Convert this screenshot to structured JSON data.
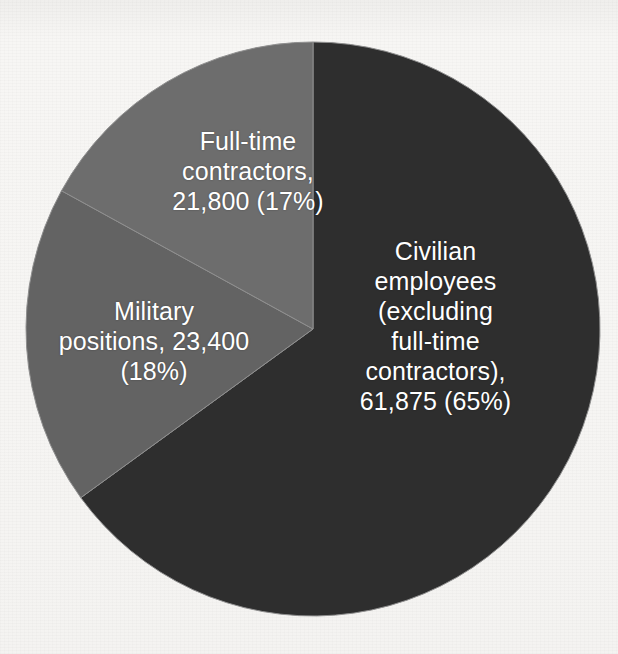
{
  "chart_data": {
    "type": "pie",
    "title": "",
    "subtitle": "",
    "xlabel": "",
    "ylabel": "",
    "legend_position": "none",
    "grid": false,
    "labels_inside_slices": true,
    "total": 107075,
    "categories": [
      "Civilian employees (excluding full-time contractors)",
      "Military positions",
      "Full-time contractors"
    ],
    "values": [
      61875,
      23400,
      21800
    ],
    "percentages": [
      65,
      18,
      17
    ],
    "slices": [
      {
        "name": "civilian-employees",
        "label": "Civilian\nemployees\n(excluding\nfull-time\ncontractors),\n61,875 (65%)",
        "value": 61875,
        "value_text": "61,875",
        "percent": 65,
        "percent_text": "(65%)",
        "color": "#2e2e2e",
        "start_angle_deg": 0,
        "sweep_deg": 234
      },
      {
        "name": "military-positions",
        "label": "Military\npositions, 23,400\n(18%)",
        "value": 23400,
        "value_text": "23,400",
        "percent": 18,
        "percent_text": "(18%)",
        "color": "#636363",
        "start_angle_deg": 234,
        "sweep_deg": 64.8
      },
      {
        "name": "full-time-contractors",
        "label": "Full-time\ncontractors,\n21,800 (17%)",
        "value": 21800,
        "value_text": "21,800",
        "percent": 17,
        "percent_text": "(17%)",
        "color": "#6d6d6d",
        "start_angle_deg": 298.8,
        "sweep_deg": 61.2
      }
    ],
    "colors": {
      "civilian": "#2e2e2e",
      "military": "#636363",
      "contractors": "#6d6d6d",
      "label_text": "#ffffff",
      "background": "#f6f5f3",
      "slice_divider": "#8f8f8f"
    },
    "geometry": {
      "center_x": 313,
      "center_y": 329,
      "radius": 287
    }
  },
  "page": {
    "background_note": "",
    "bleed_top": "",
    "bleed_bottom": ""
  }
}
